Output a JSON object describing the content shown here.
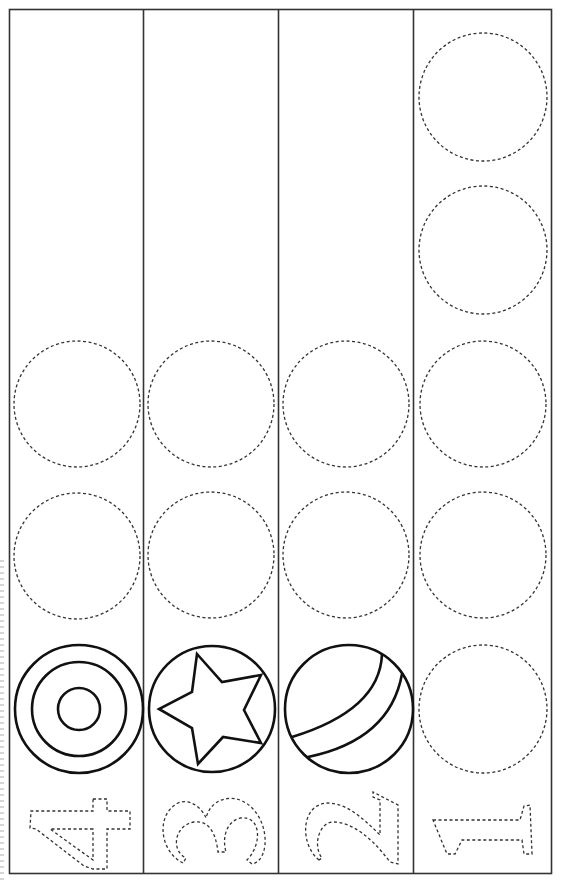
{
  "worksheet": {
    "title": "Counting worksheet 1-4",
    "colors": {
      "line": "#1a1a1a",
      "dashed": "#333333",
      "background": "#ffffff"
    },
    "columns": [
      {
        "number": "4",
        "example_picture": "target-icon",
        "trace_circles": 2
      },
      {
        "number": "3",
        "example_picture": "star-icon",
        "trace_circles": 2
      },
      {
        "number": "2",
        "example_picture": "ball-icon",
        "trace_circles": 2
      },
      {
        "number": "1",
        "example_picture": "none",
        "trace_circles": 5
      }
    ]
  }
}
